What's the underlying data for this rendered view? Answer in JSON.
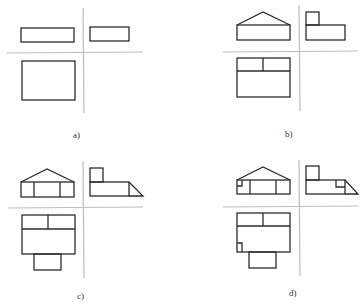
{
  "diagram": {
    "type": "orthographic-projection-steps",
    "panels": [
      {
        "id": "a",
        "label": "a)",
        "description": "Basic bounding boxes of front, side and top views"
      },
      {
        "id": "b",
        "label": "b)",
        "description": "Roof gable added to front view, raised block added to side and top views"
      },
      {
        "id": "c",
        "label": "c)",
        "description": "Wall divisions, sloped side and bottom extension added"
      },
      {
        "id": "d",
        "label": "d)",
        "description": "Small notch details added to all three views"
      }
    ]
  },
  "colors": {
    "object_line": "#2b2b2b",
    "projection_axis": "#bdbdbd",
    "background": "#ffffff"
  }
}
